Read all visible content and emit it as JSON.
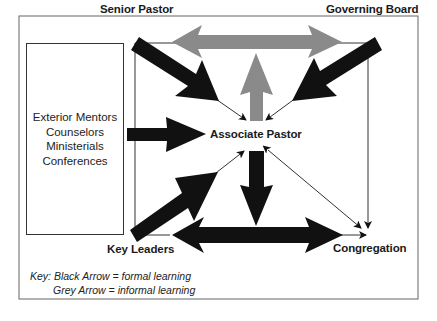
{
  "diagram": {
    "type": "learning-relationship-diagram",
    "nodes": {
      "senior_pastor": "Senior Pastor",
      "governing_board": "Governing Board",
      "associate_pastor": "Associate Pastor",
      "key_leaders": "Key Leaders",
      "congregation": "Congregation",
      "exterior": {
        "lines": [
          "Exterior Mentors",
          "Counselors",
          "Ministerials",
          "Conferences"
        ]
      }
    },
    "edges": [
      {
        "from": "Senior Pastor",
        "to": "Governing Board",
        "style": "grey",
        "direction": "both"
      },
      {
        "from": "Associate Pastor",
        "to": "Senior Pastor / Governing Board",
        "style": "grey",
        "direction": "up"
      },
      {
        "from": "Senior Pastor",
        "to": "Associate Pastor",
        "style": "black"
      },
      {
        "from": "Governing Board",
        "to": "Associate Pastor",
        "style": "black"
      },
      {
        "from": "Exterior Mentors, Counselors, Ministerials, Conferences",
        "to": "Associate Pastor",
        "style": "black"
      },
      {
        "from": "Key Leaders",
        "to": "Associate Pastor",
        "style": "black"
      },
      {
        "from": "Associate Pastor",
        "to": "Key Leaders / Congregation",
        "style": "black",
        "direction": "down"
      },
      {
        "from": "Key Leaders",
        "to": "Congregation",
        "style": "black",
        "direction": "both"
      },
      {
        "from": "Associate Pastor",
        "to": "Congregation",
        "style": "thin",
        "direction": "both"
      },
      {
        "from": "Governing Board",
        "to": "Congregation",
        "style": "thin"
      },
      {
        "from": "Senior Pastor",
        "to": "Key Leaders",
        "style": "thin-line"
      }
    ],
    "key": {
      "line1": "Key: Black Arrow = formal learning",
      "line2": "Grey Arrow = informal learning"
    },
    "colors": {
      "formal": "#111111",
      "informal": "#888888",
      "border": "#555555"
    }
  }
}
